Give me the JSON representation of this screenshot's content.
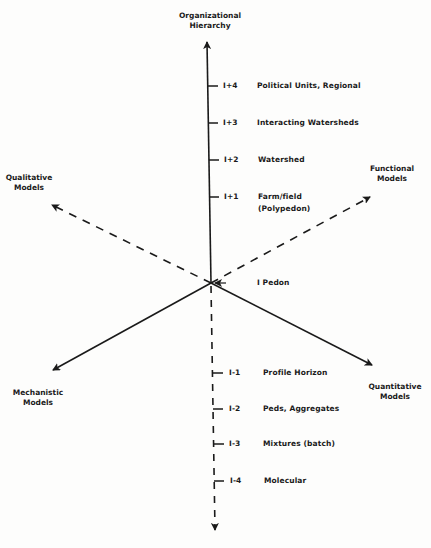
{
  "diagram": {
    "center": {
      "x": 211,
      "y": 283
    },
    "axes": {
      "vertical_up": {
        "title_line1": "Organizational",
        "title_line2": "Hierarchy",
        "style": "solid"
      },
      "vertical_down": {
        "style": "dashed"
      },
      "upper_right": {
        "title_line1": "Functional",
        "title_line2": "Models",
        "style": "dashed"
      },
      "upper_left": {
        "title_line1": "Qualitative",
        "title_line2": "Models",
        "style": "dashed"
      },
      "lower_left": {
        "title_line1": "Mechanistic",
        "title_line2": "Models",
        "style": "solid"
      },
      "lower_right": {
        "title_line1": "Quantitative",
        "title_line2": "Models",
        "style": "solid"
      }
    },
    "levels_up": [
      {
        "code": "I+4",
        "label": "Political Units, Regional"
      },
      {
        "code": "I+3",
        "label": "Interacting Watersheds"
      },
      {
        "code": "I+2",
        "label": "Watershed"
      },
      {
        "code": "I+1",
        "label": "Farm/field",
        "label2": "(Polypedon)"
      }
    ],
    "center_level": {
      "code": "I",
      "label": "Pedon"
    },
    "levels_down": [
      {
        "code": "I-1",
        "label": "Profile Horizon"
      },
      {
        "code": "I-2",
        "label": "Peds, Aggregates"
      },
      {
        "code": "I-3",
        "label": "Mixtures (batch)"
      },
      {
        "code": "I-4",
        "label": "Molecular"
      }
    ],
    "colors": {
      "ink": "#1a1a1a",
      "paper": "#fdfdfc"
    }
  }
}
